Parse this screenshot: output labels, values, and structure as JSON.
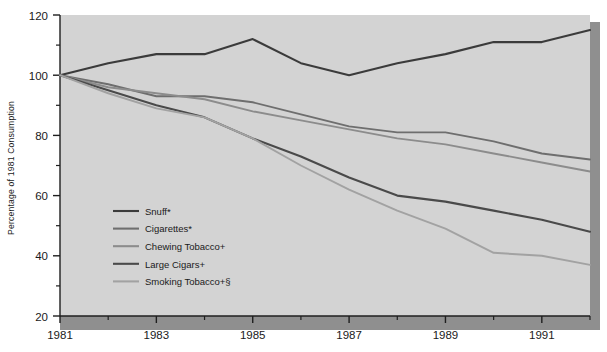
{
  "chart_data": {
    "type": "line",
    "title": "",
    "xlabel": "",
    "ylabel": "Percentage of 1981 Consumption",
    "xlim": [
      1981,
      1992
    ],
    "ylim": [
      20,
      120
    ],
    "grid": false,
    "legend_position": "lower-left-inside",
    "x_ticks": [
      "1981",
      "1983",
      "1985",
      "1987",
      "1989",
      "1991"
    ],
    "x_tick_values": [
      1981,
      1983,
      1985,
      1987,
      1989,
      1991
    ],
    "x_minor_ticks": [
      1982,
      1984,
      1986,
      1988,
      1990,
      1992
    ],
    "y_ticks": [
      "20",
      "40",
      "60",
      "80",
      "100",
      "120"
    ],
    "y_tick_values": [
      20,
      40,
      60,
      80,
      100,
      120
    ],
    "y_minor_ticks": [
      30,
      50,
      70,
      90,
      110
    ],
    "x": [
      1981,
      1982,
      1983,
      1984,
      1985,
      1986,
      1987,
      1988,
      1989,
      1990,
      1991,
      1992
    ],
    "series": [
      {
        "name": "Snuff*",
        "color": "#3b3b3b",
        "width": 2.1,
        "values": [
          100,
          104,
          107,
          107,
          112,
          104,
          100,
          104,
          107,
          111,
          111,
          115
        ]
      },
      {
        "name": "Cigarettes*",
        "color": "#6e6e6e",
        "width": 1.9,
        "values": [
          100,
          97,
          93,
          93,
          91,
          87,
          83,
          81,
          81,
          78,
          74,
          72
        ]
      },
      {
        "name": "Chewing Tobacco+",
        "color": "#8c8c8c",
        "width": 1.9,
        "values": [
          100,
          96,
          94,
          92,
          88,
          85,
          82,
          79,
          77,
          74,
          71,
          68
        ]
      },
      {
        "name": "Large Cigars+",
        "color": "#4a4a4a",
        "width": 2.1,
        "values": [
          100,
          95,
          90,
          86,
          79,
          73,
          66,
          60,
          58,
          55,
          52,
          48
        ]
      },
      {
        "name": "Smoking Tobacco+§",
        "color": "#a2a2a2",
        "width": 1.9,
        "values": [
          100,
          94,
          89,
          86,
          79,
          70,
          62,
          55,
          49,
          41,
          40,
          37
        ]
      }
    ]
  },
  "legend": {
    "items": [
      {
        "label": "Snuff*",
        "color": "#3b3b3b"
      },
      {
        "label": "Cigarettes*",
        "color": "#6e6e6e"
      },
      {
        "label": "Chewing Tobacco+",
        "color": "#8c8c8c"
      },
      {
        "label": "Large Cigars+",
        "color": "#4a4a4a"
      },
      {
        "label": "Smoking Tobacco+§",
        "color": "#a2a2a2"
      }
    ]
  },
  "colors": {
    "plot_background": "#d3d3d3",
    "axis": "#1f1f1f",
    "shadow": "#8f8f8f",
    "page_background": "#ffffff"
  }
}
